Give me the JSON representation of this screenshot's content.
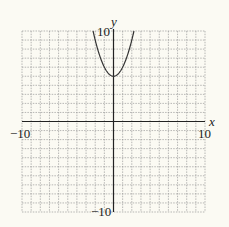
{
  "chart_data": {
    "type": "line",
    "title": "",
    "xlabel": "x",
    "ylabel": "y",
    "xlim": [
      -10,
      10
    ],
    "ylim": [
      -10,
      10
    ],
    "grid": true,
    "grid_step": 1,
    "tick_labels": {
      "x_min": "−10",
      "x_max": "10",
      "y_min": "−10",
      "y_max": "10"
    },
    "series": [
      {
        "name": "y = x^2 + 5",
        "function": "x^2 + 5",
        "vertex": [
          0,
          5
        ],
        "points": [
          [
            -2.236,
            10
          ],
          [
            -2,
            9
          ],
          [
            -1.5,
            7.25
          ],
          [
            -1,
            6
          ],
          [
            -0.5,
            5.25
          ],
          [
            0,
            5
          ],
          [
            0.5,
            5.25
          ],
          [
            1,
            6
          ],
          [
            1.5,
            7.25
          ],
          [
            2,
            9
          ],
          [
            2.236,
            10
          ]
        ],
        "color": "#333333"
      }
    ],
    "colors": {
      "background": "#fbfaf3",
      "grid": "#9a9a9a",
      "axis": "#222222"
    }
  }
}
